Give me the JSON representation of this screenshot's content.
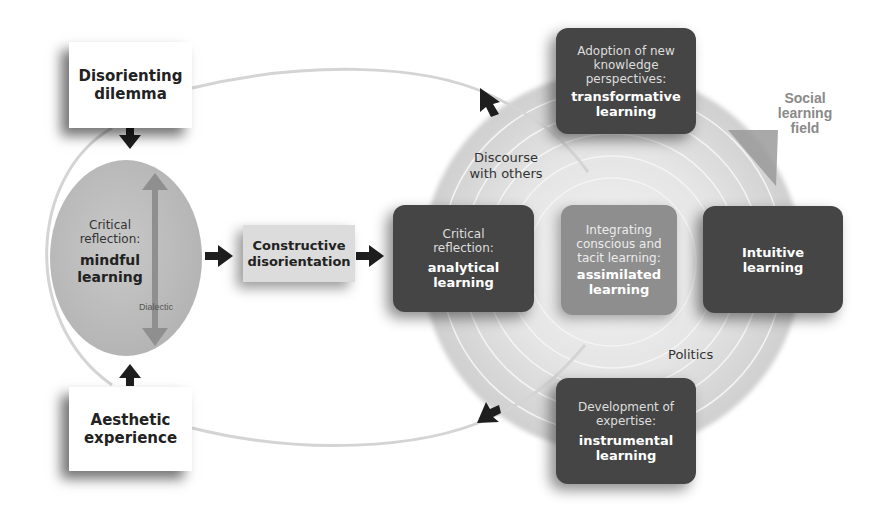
{
  "diagram": {
    "nodes": {
      "disorienting_dilemma": {
        "line1": "Disorienting",
        "line2": "dilemma"
      },
      "aesthetic_experience": {
        "line1": "Aesthetic",
        "line2": "experience"
      },
      "mindful": {
        "sub1": "Critical",
        "sub2": "reflection:",
        "main1": "mindful",
        "main2": "learning"
      },
      "dialectic_label": "Dialectic",
      "constructive": {
        "line1": "Constructive",
        "line2": "disorientation"
      },
      "analytical": {
        "sub1": "Critical",
        "sub2": "reflection:",
        "main1": "analytical",
        "main2": "learning"
      },
      "assimilated": {
        "sub1": "Integrating",
        "sub2": "conscious and",
        "sub3": "tacit learning:",
        "main1": "assimilated",
        "main2": "learning"
      },
      "intuitive": {
        "main1": "Intuitive",
        "main2": "learning"
      },
      "transformative": {
        "sub1": "Adoption of new",
        "sub2": "knowledge",
        "sub3": "perspectives:",
        "main1": "transformative",
        "main2": "learning"
      },
      "instrumental": {
        "sub1": "Development of",
        "sub2": "expertise:",
        "main1": "instrumental",
        "main2": "learning"
      }
    },
    "labels": {
      "discourse": {
        "line1": "Discourse",
        "line2": "with others"
      },
      "politics": "Politics",
      "social_field": {
        "line1": "Social",
        "line2": "learning",
        "line3": "field"
      }
    },
    "colors": {
      "dark_box": "#454545",
      "mid_box": "#8e8e8e",
      "ellipse": "#b5b5b5",
      "field_circle": "#e0e0e0",
      "arrow": "#222222",
      "loop_line": "#d6d6d6"
    },
    "edges": [
      {
        "from": "Disorienting dilemma",
        "to": "mindful learning"
      },
      {
        "from": "Aesthetic experience",
        "to": "mindful learning"
      },
      {
        "from": "mindful learning",
        "to": "Constructive disorientation"
      },
      {
        "from": "Constructive disorientation",
        "to": "analytical learning"
      },
      {
        "from": "transformative learning",
        "to": "Disorienting dilemma",
        "style": "loop"
      },
      {
        "from": "instrumental learning",
        "to": "Aesthetic experience",
        "style": "loop"
      }
    ]
  }
}
